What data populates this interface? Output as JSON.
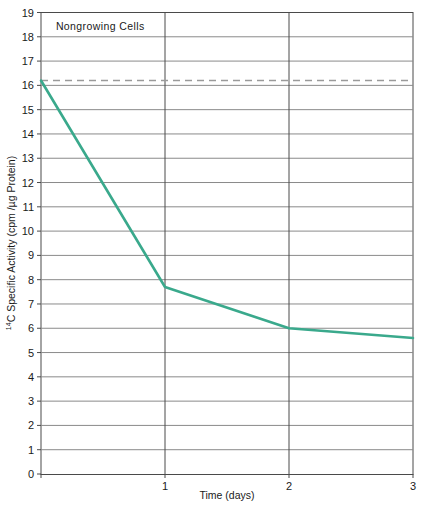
{
  "chart_data": {
    "type": "line",
    "title": "Nongrowing Cells",
    "xlabel": "Time (days)",
    "ylabel_main": "C Specific Activity (cpm /µg Protein)",
    "ylabel_superscript": "14",
    "ylabel_full": "14C Specific Activity (cpm /µg Protein)",
    "xlim": [
      0,
      3
    ],
    "ylim": [
      0,
      19
    ],
    "grid": true,
    "legend": "none",
    "xticks": [
      0,
      1,
      2,
      3
    ],
    "xtick_labels": [
      "",
      "1",
      "2",
      "3"
    ],
    "yticks": [
      0,
      1,
      2,
      3,
      4,
      5,
      6,
      7,
      8,
      9,
      10,
      11,
      12,
      13,
      14,
      15,
      16,
      17,
      18,
      19
    ],
    "ytick_labels": [
      "0",
      "1",
      "2",
      "3",
      "4",
      "5",
      "6",
      "7",
      "8",
      "9",
      "10",
      "11",
      "12",
      "13",
      "14",
      "15",
      "16",
      "17",
      "18",
      "19"
    ],
    "series": [
      {
        "name": "14C specific activity",
        "color": "#3aa98c",
        "style": "solid",
        "x": [
          0,
          1,
          2,
          3
        ],
        "values": [
          16.2,
          7.7,
          6.0,
          5.6
        ]
      },
      {
        "name": "initial level reference",
        "color": "#9a9a9a",
        "style": "dashed",
        "x": [
          0,
          3
        ],
        "values": [
          16.2,
          16.2
        ]
      }
    ],
    "annotations": [
      {
        "text": "Nongrowing Cells",
        "x": 0.12,
        "y": 18.3
      }
    ],
    "colors": {
      "line": "#3aa98c",
      "dashed_reference": "#9a9a9a",
      "gridline": "#8a8a8a",
      "axis": "#4a4a4a",
      "background": "#ffffff",
      "text": "#1a1a1a"
    }
  }
}
